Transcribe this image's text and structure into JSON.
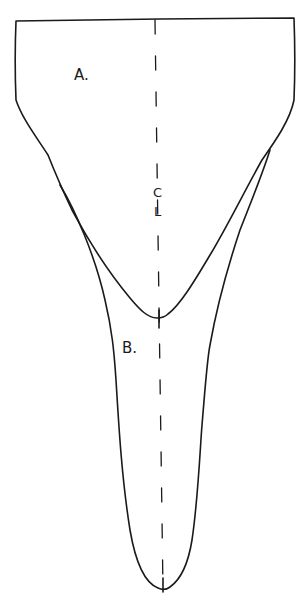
{
  "diagram": {
    "type": "sewing-pattern",
    "pieces": [
      {
        "id": "A",
        "label": "A."
      },
      {
        "id": "B",
        "label": "B."
      }
    ],
    "centerline": {
      "label_top": "C",
      "label_bottom": "L"
    },
    "colors": {
      "ink": "#1a1a1a",
      "paper": "#ffffff"
    }
  }
}
